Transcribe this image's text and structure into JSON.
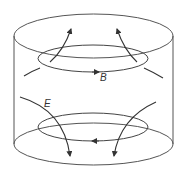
{
  "diagram": {
    "title": "",
    "labels": {
      "magnetic_field": "B",
      "electric_field": "E"
    },
    "elements": [
      "cylinder",
      "upper-field-loop-B",
      "lower-field-loop",
      "E-field-lines-upward",
      "E-field-lines-downward"
    ],
    "colors": {
      "stroke": "#444444",
      "background": "#ffffff"
    }
  }
}
